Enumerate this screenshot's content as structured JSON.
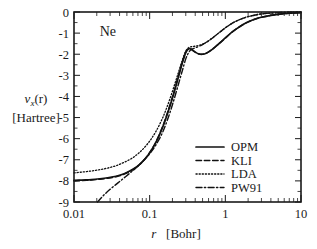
{
  "chart_data": {
    "type": "line",
    "title": "",
    "annotation": "Ne",
    "xlabel": "r   [Bohr]",
    "xlabel_symbol": "r",
    "xlabel_unit": "[Bohr]",
    "ylabel": "v_x(r)",
    "ylabel_symbol": "v",
    "ylabel_subscript": "x",
    "ylabel_arg": "(r)",
    "ylabel_unit": "[Hartree]",
    "xscale": "log",
    "yscale": "linear",
    "xlim": [
      0.01,
      10
    ],
    "ylim": [
      -9,
      0
    ],
    "grid": false,
    "legend_position": "lower right",
    "xticks": [
      0.01,
      0.1,
      1,
      10
    ],
    "xtick_labels": [
      "0.01",
      "0.1",
      "1",
      "10"
    ],
    "yticks": [
      0,
      -1,
      -2,
      -3,
      -4,
      -5,
      -6,
      -7,
      -8,
      -9
    ],
    "ytick_labels": [
      "0",
      "-1",
      "-2",
      "-3",
      "-4",
      "-5",
      "-6",
      "-7",
      "-8",
      "-9"
    ],
    "series": [
      {
        "name": "OPM",
        "style": "solid",
        "color": "#111111",
        "x": [
          0.01,
          0.013,
          0.017,
          0.022,
          0.028,
          0.036,
          0.046,
          0.06,
          0.075,
          0.095,
          0.12,
          0.15,
          0.18,
          0.21,
          0.24,
          0.27,
          0.3,
          0.33,
          0.36,
          0.4,
          0.45,
          0.5,
          0.56,
          0.63,
          0.71,
          0.8,
          0.9,
          1.0,
          1.2,
          1.4,
          1.7,
          2.0,
          2.5,
          3.0,
          4.0,
          5.0,
          7.0,
          10.0
        ],
        "y": [
          -7.98,
          -7.96,
          -7.94,
          -7.9,
          -7.85,
          -7.78,
          -7.66,
          -7.45,
          -7.19,
          -6.78,
          -6.2,
          -5.42,
          -4.6,
          -3.82,
          -3.08,
          -2.42,
          -1.92,
          -1.74,
          -1.78,
          -1.9,
          -1.99,
          -2.0,
          -1.95,
          -1.84,
          -1.7,
          -1.54,
          -1.38,
          -1.23,
          -0.98,
          -0.8,
          -0.6,
          -0.47,
          -0.33,
          -0.25,
          -0.16,
          -0.11,
          -0.06,
          -0.03
        ]
      },
      {
        "name": "KLI",
        "style": "dashed",
        "color": "#111111",
        "x": [
          0.01,
          0.013,
          0.017,
          0.022,
          0.028,
          0.036,
          0.046,
          0.06,
          0.075,
          0.095,
          0.12,
          0.15,
          0.18,
          0.21,
          0.24,
          0.27,
          0.3,
          0.33,
          0.36,
          0.4,
          0.45,
          0.5,
          0.56,
          0.63,
          0.71,
          0.8,
          0.9,
          1.0,
          1.2,
          1.4,
          1.7,
          2.0,
          2.5,
          3.0,
          4.0,
          5.0,
          7.0,
          10.0
        ],
        "y": [
          -8.0,
          -7.98,
          -7.96,
          -7.92,
          -7.87,
          -7.8,
          -7.68,
          -7.47,
          -7.2,
          -6.78,
          -6.18,
          -5.38,
          -4.55,
          -3.76,
          -3.02,
          -2.38,
          -1.9,
          -1.73,
          -1.78,
          -1.9,
          -1.99,
          -2.0,
          -1.95,
          -1.84,
          -1.7,
          -1.54,
          -1.38,
          -1.23,
          -0.98,
          -0.8,
          -0.6,
          -0.47,
          -0.33,
          -0.25,
          -0.16,
          -0.11,
          -0.06,
          -0.03
        ]
      },
      {
        "name": "LDA",
        "style": "dotted",
        "color": "#111111",
        "x": [
          0.01,
          0.013,
          0.017,
          0.022,
          0.028,
          0.036,
          0.046,
          0.06,
          0.075,
          0.095,
          0.12,
          0.15,
          0.18,
          0.21,
          0.24,
          0.27,
          0.3,
          0.33,
          0.36,
          0.4,
          0.45,
          0.5,
          0.56,
          0.63,
          0.71,
          0.8,
          0.9,
          1.0,
          1.2,
          1.4,
          1.7,
          2.0,
          2.5,
          3.0,
          4.0,
          5.0,
          7.0,
          10.0
        ],
        "y": [
          -7.62,
          -7.58,
          -7.53,
          -7.47,
          -7.39,
          -7.28,
          -7.12,
          -6.9,
          -6.62,
          -6.22,
          -5.68,
          -4.98,
          -4.24,
          -3.52,
          -2.86,
          -2.28,
          -1.85,
          -1.68,
          -1.64,
          -1.62,
          -1.58,
          -1.52,
          -1.43,
          -1.31,
          -1.17,
          -1.02,
          -0.88,
          -0.75,
          -0.56,
          -0.43,
          -0.3,
          -0.22,
          -0.14,
          -0.09,
          -0.05,
          -0.03,
          -0.01,
          -0.005
        ]
      },
      {
        "name": "PW91",
        "style": "dashdot",
        "color": "#111111",
        "x": [
          0.0205,
          0.023,
          0.026,
          0.03,
          0.035,
          0.041,
          0.048,
          0.057,
          0.068,
          0.082,
          0.1,
          0.12,
          0.15,
          0.18,
          0.21,
          0.24,
          0.27,
          0.3,
          0.33,
          0.36,
          0.4,
          0.45,
          0.5,
          0.56,
          0.63,
          0.71,
          0.8,
          0.9,
          1.0,
          1.2,
          1.4,
          1.7,
          2.0,
          2.5,
          3.0,
          4.0,
          5.0,
          7.0,
          10.0
        ],
        "y": [
          -9.0,
          -8.8,
          -8.6,
          -8.4,
          -8.2,
          -8.0,
          -7.8,
          -7.58,
          -7.34,
          -7.06,
          -6.72,
          -6.32,
          -5.66,
          -4.9,
          -4.14,
          -3.42,
          -2.78,
          -2.22,
          -1.9,
          -1.76,
          -1.7,
          -1.62,
          -1.54,
          -1.44,
          -1.31,
          -1.17,
          -1.02,
          -0.88,
          -0.75,
          -0.56,
          -0.43,
          -0.3,
          -0.22,
          -0.14,
          -0.09,
          -0.05,
          -0.03,
          -0.01,
          -0.005
        ]
      }
    ]
  },
  "legend": {
    "entries": [
      {
        "label": "OPM",
        "style": "solid"
      },
      {
        "label": "KLI",
        "style": "dashed"
      },
      {
        "label": "LDA",
        "style": "dotted"
      },
      {
        "label": "PW91",
        "style": "dashdot"
      }
    ]
  }
}
